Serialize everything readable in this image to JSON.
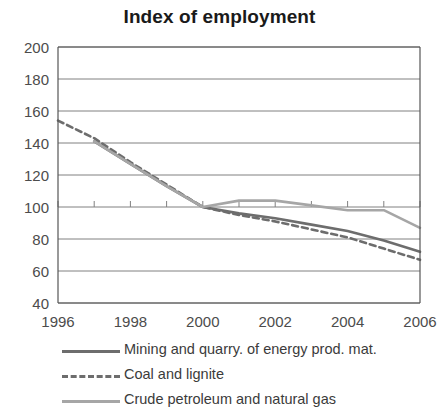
{
  "chart_data": {
    "type": "line",
    "title": "Index of employment",
    "xlabel": "",
    "ylabel": "",
    "x": [
      1996,
      1997,
      1998,
      1999,
      2000,
      2001,
      2002,
      2003,
      2004,
      2005,
      2006
    ],
    "xlim": [
      1996,
      2006
    ],
    "ylim": [
      40,
      200
    ],
    "yticks": [
      40,
      60,
      80,
      100,
      120,
      140,
      160,
      180,
      200
    ],
    "xticks": [
      1996,
      1998,
      2000,
      2002,
      2004,
      2006
    ],
    "xtick_labels": [
      "1996",
      "1998",
      "2000",
      "2002",
      "2004",
      "2006"
    ],
    "ytick_labels": [
      "40",
      "60",
      "80",
      "100",
      "120",
      "140",
      "160",
      "180",
      "200"
    ],
    "grid": true,
    "legend_position": "below",
    "series": [
      {
        "name": "Mining and quarry. of energy prod. mat.",
        "style": "solid",
        "color": "#6d6d6d",
        "values": [
          null,
          141,
          127,
          113,
          100,
          96,
          93,
          89,
          85,
          79,
          72
        ]
      },
      {
        "name": "Coal and lignite",
        "style": "dashed",
        "color": "#6d6d6d",
        "values": [
          154,
          143,
          128,
          114,
          100,
          95,
          91,
          86,
          81,
          74,
          67
        ]
      },
      {
        "name": "Crude petroleum and natural gas",
        "style": "solid",
        "color": "#a6a6a6",
        "values": [
          null,
          141,
          127,
          113,
          100,
          104,
          104,
          101,
          98,
          98,
          87
        ]
      }
    ]
  },
  "legend": {
    "items": [
      {
        "label": "Mining and quarry. of energy prod. mat."
      },
      {
        "label": "Coal and lignite"
      },
      {
        "label": "Crude petroleum and natural gas"
      }
    ]
  },
  "colors": {
    "axis": "#555555",
    "grid": "#808080",
    "series_dark": "#6d6d6d",
    "series_light": "#a6a6a6",
    "text": "#3b3b3b",
    "background": "#ffffff"
  }
}
